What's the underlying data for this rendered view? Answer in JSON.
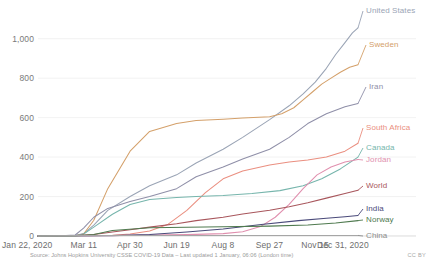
{
  "chart_data": {
    "type": "line",
    "title": "",
    "subtitle": "",
    "xlabel": "",
    "ylabel": "",
    "grid": true,
    "legend_position": "right-inline-labels",
    "xlim": [
      0,
      344
    ],
    "ylim": [
      0,
      1100
    ],
    "yticks": [
      0,
      200,
      400,
      600,
      800,
      1000
    ],
    "ytick_labels": [
      "0",
      "200",
      "400",
      "600",
      "800",
      "1,000"
    ],
    "xticks": [
      0,
      49,
      99,
      149,
      199,
      249,
      298,
      344
    ],
    "xtick_labels": [
      "Jan 22, 2020",
      "Mar 11",
      "Apr 30",
      "Jun 19",
      "Aug 8",
      "Sep 27",
      "Nov 15",
      "Dec 31, 2020"
    ],
    "x_unit": "days since Jan 22 2020",
    "series": [
      {
        "name": "United States",
        "color": "#9aa4b5",
        "label": "United States",
        "label_x": 366,
        "label_y": 11,
        "x": [
          0,
          20,
          40,
          49,
          60,
          75,
          99,
          120,
          149,
          170,
          199,
          220,
          249,
          270,
          285,
          298,
          310,
          320,
          330,
          338,
          344
        ],
        "values": [
          0,
          0,
          2,
          12,
          55,
          130,
          200,
          255,
          310,
          370,
          440,
          500,
          590,
          660,
          720,
          780,
          850,
          920,
          980,
          1030,
          1055
        ]
      },
      {
        "name": "Sweden",
        "color": "#d4a06a",
        "label": "Sweden",
        "label_x": 369,
        "label_y": 45,
        "x": [
          0,
          20,
          40,
          49,
          60,
          75,
          99,
          120,
          149,
          170,
          199,
          220,
          249,
          262,
          275,
          285,
          295,
          305,
          315,
          325,
          335,
          344
        ],
        "values": [
          0,
          0,
          1,
          10,
          80,
          240,
          430,
          530,
          570,
          585,
          592,
          598,
          605,
          620,
          650,
          690,
          730,
          770,
          800,
          830,
          855,
          868
        ]
      },
      {
        "name": "Iran",
        "color": "#8f8fa8",
        "label": "Iran",
        "label_x": 369,
        "label_y": 87,
        "x": [
          0,
          20,
          40,
          49,
          60,
          75,
          99,
          120,
          149,
          170,
          199,
          220,
          249,
          270,
          290,
          310,
          330,
          344
        ],
        "values": [
          0,
          0,
          5,
          40,
          95,
          140,
          175,
          200,
          240,
          300,
          350,
          390,
          440,
          500,
          570,
          620,
          655,
          672
        ]
      },
      {
        "name": "South Africa",
        "color": "#ea8f80",
        "label": "South Africa",
        "label_x": 366,
        "label_y": 128,
        "x": [
          0,
          40,
          60,
          80,
          99,
          120,
          140,
          160,
          180,
          199,
          220,
          249,
          270,
          290,
          310,
          330,
          344
        ],
        "values": [
          0,
          0,
          1,
          4,
          10,
          25,
          60,
          130,
          220,
          290,
          330,
          360,
          375,
          385,
          400,
          430,
          470
        ]
      },
      {
        "name": "Canada",
        "color": "#76b5ac",
        "label": "Canada",
        "label_x": 366,
        "label_y": 148,
        "x": [
          0,
          20,
          40,
          49,
          60,
          80,
          99,
          120,
          149,
          170,
          199,
          230,
          260,
          285,
          305,
          325,
          344
        ],
        "values": [
          0,
          0,
          1,
          10,
          45,
          110,
          160,
          185,
          195,
          200,
          205,
          215,
          230,
          255,
          290,
          340,
          400
        ]
      },
      {
        "name": "Jordan",
        "color": "#e08fae",
        "label": "Jordan",
        "label_x": 366,
        "label_y": 160,
        "x": [
          0,
          40,
          80,
          120,
          160,
          199,
          220,
          240,
          255,
          270,
          285,
          300,
          315,
          330,
          344
        ],
        "values": [
          0,
          0,
          2,
          5,
          7,
          12,
          22,
          50,
          95,
          160,
          240,
          310,
          350,
          375,
          388
        ]
      },
      {
        "name": "World",
        "color": "#a8565c",
        "label": "World",
        "label_x": 366,
        "label_y": 186,
        "x": [
          0,
          20,
          40,
          60,
          80,
          99,
          120,
          149,
          170,
          199,
          220,
          249,
          270,
          290,
          310,
          330,
          344
        ],
        "values": [
          0,
          0,
          2,
          8,
          20,
          32,
          45,
          62,
          78,
          95,
          112,
          130,
          148,
          168,
          192,
          215,
          232
        ]
      },
      {
        "name": "India",
        "color": "#4a4a7a",
        "label": "India",
        "label_x": 366,
        "label_y": 209,
        "x": [
          0,
          40,
          80,
          120,
          160,
          199,
          240,
          280,
          310,
          330,
          344
        ],
        "values": [
          0,
          0,
          2,
          8,
          20,
          35,
          58,
          78,
          90,
          98,
          104
        ]
      },
      {
        "name": "Norway",
        "color": "#4f7a4f",
        "label": "Norway",
        "label_x": 366,
        "label_y": 220,
        "x": [
          0,
          40,
          60,
          80,
          120,
          160,
          199,
          249,
          290,
          320,
          344
        ],
        "values": [
          0,
          0,
          8,
          28,
          42,
          44,
          47,
          50,
          56,
          66,
          78
        ]
      },
      {
        "name": "China",
        "color": "#8c8c8c",
        "label": "China",
        "label_x": 366,
        "label_y": 236,
        "x": [
          0,
          20,
          40,
          60,
          99,
          149,
          199,
          249,
          299,
          344
        ],
        "values": [
          0,
          1,
          2,
          3,
          3,
          3,
          3,
          3,
          3,
          3
        ]
      }
    ]
  },
  "footer": {
    "source": "Source: Johns Hopkins University CSSE COVID-19 Data – Last updated 1 January, 06:06 (London time)",
    "license": "CC BY"
  },
  "colors": {
    "grid": "#ececec",
    "axis_text": "#6e6e6e",
    "background": "#ffffff"
  }
}
